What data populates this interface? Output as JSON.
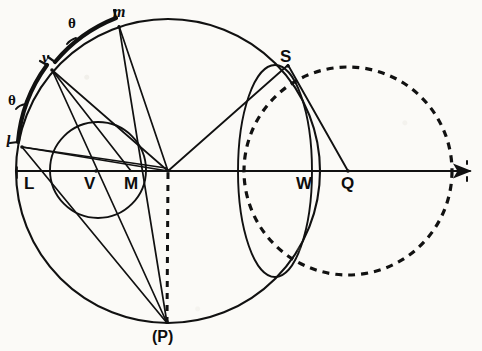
{
  "figure": {
    "kind": "geometric-construction-diagram",
    "width": 482,
    "height": 351,
    "ink_color": "#111111",
    "paper_color": "#fbfaf7"
  },
  "labels": {
    "m": "m",
    "v": "v",
    "l": "l",
    "L": "L",
    "V": "V",
    "M": "M",
    "S": "S",
    "W": "W",
    "Q": "Q",
    "P": "(P)",
    "theta_upper": "θ",
    "theta_lower": "θ"
  },
  "points": {
    "m": {
      "x": 119,
      "y": 26,
      "label": "m"
    },
    "v": {
      "x": 52,
      "y": 70,
      "label": "v"
    },
    "l": {
      "x": 22,
      "y": 147,
      "label": "l"
    },
    "L": {
      "x": 20,
      "y": 171,
      "label": "L"
    },
    "V": {
      "x": 96,
      "y": 171,
      "label": "V"
    },
    "M": {
      "x": 131,
      "y": 171,
      "label": "M"
    },
    "C": {
      "x": 168,
      "y": 171,
      "label": ""
    },
    "S": {
      "x": 288,
      "y": 65,
      "label": "S"
    },
    "W": {
      "x": 306,
      "y": 171,
      "label": "W"
    },
    "Q": {
      "x": 348,
      "y": 171,
      "label": "Q"
    },
    "P": {
      "x": 167,
      "y": 323,
      "label": "(P)"
    }
  },
  "circles": {
    "main": {
      "cx": 168,
      "cy": 171,
      "r": 152,
      "style": "solid",
      "stroke": "#111111"
    },
    "small": {
      "cx": 98,
      "cy": 170,
      "r": 48,
      "style": "solid",
      "stroke": "#111111"
    },
    "w_circle": {
      "cx": 275,
      "cy": 171,
      "r": 37,
      "ry": 106,
      "style": "solid",
      "stroke": "#111111"
    },
    "dashed": {
      "cx": 348,
      "cy": 171,
      "r": 104,
      "style": "dashed",
      "stroke": "#111111"
    }
  },
  "axis": {
    "from_x": 17,
    "to_x": 474,
    "y": 171,
    "arrowhead": true,
    "end_tick": true
  },
  "segments": [
    {
      "name": "v-to-C",
      "from": "v",
      "to": "C"
    },
    {
      "name": "v-to-M",
      "from": "v",
      "to": "M"
    },
    {
      "name": "v-to-P",
      "from": "v",
      "to": "P"
    },
    {
      "name": "m-to-C",
      "from": "m",
      "to": "C"
    },
    {
      "name": "m-to-P",
      "from": "m",
      "to": "P"
    },
    {
      "name": "l-to-C",
      "from": "l",
      "to": "C"
    },
    {
      "name": "l-to-P",
      "from": "l",
      "to": "P"
    },
    {
      "name": "C-to-S",
      "from": "C",
      "to": "S"
    },
    {
      "name": "S-to-Q",
      "from": "S",
      "to": "Q"
    },
    {
      "name": "C-to-P-dashed",
      "from": "C",
      "to": "P",
      "style": "dashed"
    }
  ],
  "arc_braces": [
    {
      "name": "theta-arc-upper",
      "label": "θ",
      "between": [
        "v",
        "m"
      ]
    },
    {
      "name": "theta-arc-lower",
      "label": "θ",
      "between": [
        "l",
        "v"
      ]
    }
  ]
}
